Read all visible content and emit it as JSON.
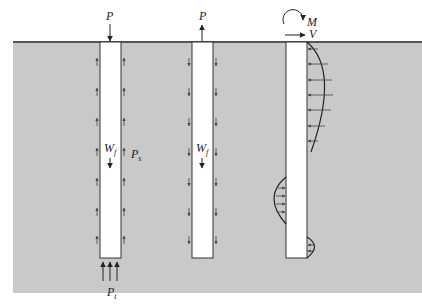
{
  "diagram": {
    "colors": {
      "soil": "#c9c9c9",
      "ground_line": "#555555",
      "pile": "#ffffff",
      "stroke": "#333333"
    },
    "pile_axial_compression": {
      "applied_load": "P",
      "self_weight": "W",
      "self_weight_sub": "f",
      "side_friction": "P",
      "side_friction_sub": "s",
      "tip_resistance": "P",
      "tip_resistance_sub": "t"
    },
    "pile_uplift": {
      "applied_load": "P",
      "self_weight": "W",
      "self_weight_sub": "f"
    },
    "pile_lateral": {
      "moment": "M",
      "shear": "V"
    }
  }
}
